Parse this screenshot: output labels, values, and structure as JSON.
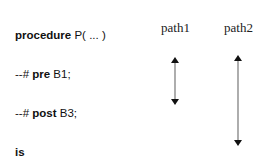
{
  "code": {
    "lines": [
      {
        "kw": "procedure",
        "rest": " P( ... )",
        "prefix": "",
        "indent": false
      },
      {
        "prefix": "--# ",
        "kw": "pre",
        "rest": " B1;",
        "indent": false
      },
      {
        "prefix": "--# ",
        "kw": "post",
        "rest": " B3;",
        "indent": false
      },
      {
        "prefix": "",
        "kw": "is",
        "rest": "",
        "indent": false
      },
      {
        "prefix": "",
        "kw": "begin",
        "rest": "",
        "indent": false
      },
      {
        "prefix": "...    -- some code",
        "kw": "",
        "rest": "",
        "indent": true
      },
      {
        "prefix": "...",
        "kw": "",
        "rest": "",
        "indent": true
      },
      {
        "prefix": "--# ",
        "kw": "check",
        "rest": " B2;",
        "indent": true
      },
      {
        "prefix": "...    -- more code",
        "kw": "",
        "rest": "",
        "indent": true
      },
      {
        "prefix": "...",
        "kw": "",
        "rest": "",
        "indent": true
      },
      {
        "prefix": "",
        "kw": "end",
        "rest": " P;",
        "indent": false
      }
    ]
  },
  "paths": [
    {
      "label": "path1",
      "x": 175,
      "y1": 57,
      "y2": 105
    },
    {
      "label": "path2",
      "x": 238,
      "y1": 55,
      "y2": 146
    }
  ]
}
